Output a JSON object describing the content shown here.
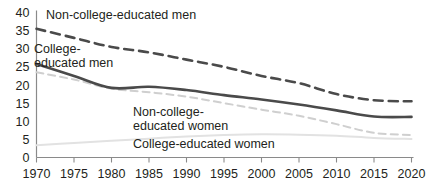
{
  "chart_data": {
    "type": "line",
    "title": "",
    "subtitle": "",
    "xlabel": "",
    "ylabel": "",
    "xlim": [
      1970,
      2020
    ],
    "ylim": [
      0,
      40
    ],
    "grid": false,
    "legend_position": "inline-annotations",
    "x": [
      1970,
      1975,
      1980,
      1985,
      1990,
      1995,
      2000,
      2005,
      2010,
      2015,
      2020
    ],
    "y_ticks": [
      0,
      5,
      10,
      15,
      20,
      25,
      30,
      35,
      40
    ],
    "x_ticks": [
      1970,
      1975,
      1980,
      1985,
      1990,
      1995,
      2000,
      2005,
      2010,
      2015,
      2020
    ],
    "x_tick_labels": [
      "1970",
      "1975",
      "1980",
      "1985",
      "1990",
      "1995",
      "2000",
      "2005",
      "2010",
      "2015",
      "2020"
    ],
    "y_tick_labels": [
      "0",
      "5",
      "10",
      "15",
      "20",
      "25",
      "30",
      "35",
      "40"
    ],
    "series": [
      {
        "name": "Non-college-educated men",
        "style": "dashed",
        "color": "#4a4a4a",
        "width": 2.6,
        "values": [
          35.5,
          33.0,
          30.5,
          29.0,
          27.0,
          25.0,
          22.5,
          20.5,
          17.5,
          15.8,
          15.5
        ]
      },
      {
        "name": "College-educated men",
        "style": "solid",
        "color": "#4a4a4a",
        "width": 2.6,
        "values": [
          25.8,
          22.5,
          19.2,
          19.5,
          18.6,
          17.2,
          16.0,
          14.6,
          13.0,
          11.3,
          11.2
        ]
      },
      {
        "name": "Non-college-educated women",
        "style": "dashed",
        "color": "#cfcfcf",
        "width": 2.0,
        "values": [
          23.5,
          21.5,
          19.0,
          18.0,
          16.8,
          15.0,
          13.2,
          11.5,
          9.2,
          6.8,
          6.2
        ]
      },
      {
        "name": "College-educated women",
        "style": "solid",
        "color": "#e2e2e2",
        "width": 2.0,
        "values": [
          3.4,
          4.0,
          4.6,
          5.2,
          5.8,
          6.2,
          6.4,
          6.3,
          6.0,
          5.4,
          5.1
        ]
      }
    ],
    "annotations": [
      {
        "id": "ann-noncollege-men",
        "lines": [
          "Non-college-educated men"
        ],
        "x": 46,
        "y": 19,
        "align": "start"
      },
      {
        "id": "ann-college-men",
        "lines": [
          "College-",
          "educated men"
        ],
        "x": 34,
        "y": 53,
        "align": "start"
      },
      {
        "id": "ann-noncollege-women",
        "lines": [
          "Non-college-",
          "educated women"
        ],
        "x": 133,
        "y": 116,
        "align": "start"
      },
      {
        "id": "ann-college-women",
        "lines": [
          "College-educated women"
        ],
        "x": 133,
        "y": 148,
        "align": "start"
      }
    ]
  },
  "axis": {
    "y_axis_name": "y-axis",
    "x_axis_name": "x-axis"
  }
}
